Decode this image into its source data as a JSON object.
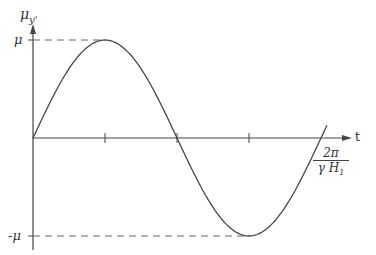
{
  "diagram": {
    "y_axis_label": "μ",
    "y_axis_sub": "y'",
    "x_axis_label": "t",
    "y_max_label": "μ",
    "y_min_label": "-μ",
    "period_label_num": "2π",
    "period_label_den": "γ H",
    "period_label_den_sub": "1",
    "curve": "sine",
    "colors": {
      "line": "#444444",
      "dash": "#666666"
    }
  }
}
